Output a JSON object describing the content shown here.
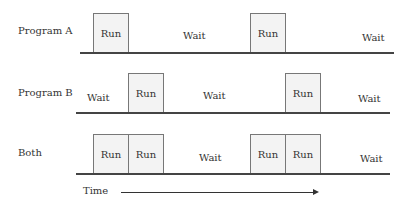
{
  "rows": [
    {
      "label": "Program A",
      "run": "Run",
      "wait1": "Wait",
      "run2": "Run",
      "wait2": "Wait"
    },
    {
      "label": "Program B",
      "wait0": "Wait",
      "run": "Run",
      "wait1": "Wait",
      "run2": "Run",
      "wait2": "Wait"
    },
    {
      "label": "Both",
      "run_a": "Run",
      "run_b": "Run",
      "wait1": "Wait",
      "run_a2": "Run",
      "run_b2": "Run",
      "wait2": "Wait"
    }
  ],
  "axis": {
    "label": "Time"
  }
}
